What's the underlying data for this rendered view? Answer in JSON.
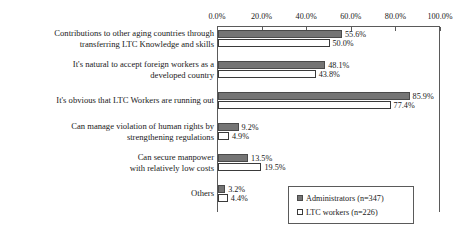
{
  "chart_data": {
    "type": "bar",
    "orientation": "horizontal",
    "title": "",
    "xlabel": "",
    "ylabel": "",
    "xlim": [
      0,
      100
    ],
    "xticks": [
      "0.0%",
      "20.0%",
      "40.0%",
      "60.0%",
      "80.0%",
      "100.0%"
    ],
    "xtick_values": [
      0,
      20,
      40,
      60,
      80,
      100
    ],
    "grid": false,
    "legend_position": "bottom-right",
    "categories": [
      "Contributions to other aging countries through transferring LTC Knowledge and skills",
      "It's natural to accept foreign workers as a developed country",
      "It's obvious that LTC Workers are running out",
      "Can manage violation of human rights by strengthening regulations",
      "Can secure manpower with relatively low costs",
      "Others"
    ],
    "category_lines": [
      [
        "Contributions to other aging countries through",
        "transferring LTC Knowledge and skills"
      ],
      [
        "It's natural to accept foreign workers as a",
        "developed country"
      ],
      [
        "It's obvious that LTC Workers are running out"
      ],
      [
        "Can manage violation of human rights by",
        "strengthening regulations"
      ],
      [
        "Can secure manpower",
        "with relatively low costs"
      ],
      [
        "Others"
      ]
    ],
    "series": [
      {
        "name": "Administrators (n=347)",
        "key": "admin",
        "color": "#757575",
        "values": [
          55.6,
          48.1,
          85.9,
          9.2,
          13.5,
          3.2
        ],
        "labels": [
          "55.6%",
          "48.1%",
          "85.9%",
          "9.2%",
          "13.5%",
          "3.2%"
        ]
      },
      {
        "name": "LTC workers (n=226)",
        "key": "ltc",
        "color": "#ffffff",
        "values": [
          50.0,
          43.8,
          77.4,
          4.9,
          19.5,
          4.4
        ],
        "labels": [
          "50.0%",
          "43.8%",
          "77.4%",
          "4.9%",
          "19.5%",
          "4.4%"
        ]
      }
    ]
  },
  "legend": {
    "items": [
      {
        "label": "Administrators (n=347)",
        "swatch": "filled-square-icon"
      },
      {
        "label": "LTC workers (n=226)",
        "swatch": "empty-square-icon"
      }
    ]
  }
}
